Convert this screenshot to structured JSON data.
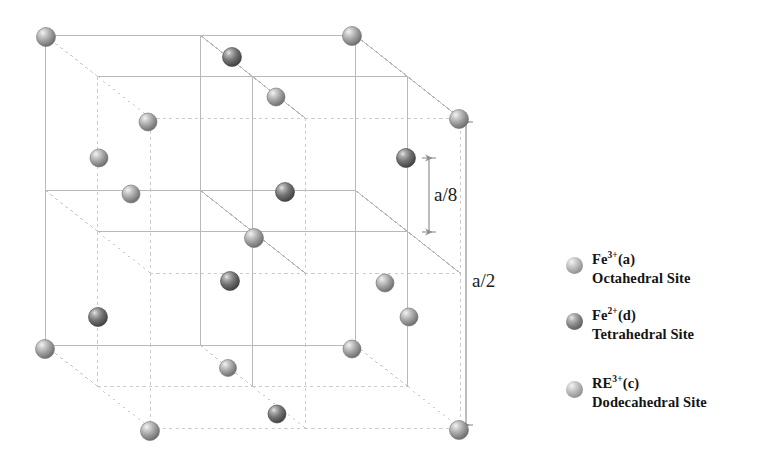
{
  "figure": {
    "name": "garnet-unit-cell-octant",
    "background_color": "#ffffff",
    "line_color": "#b9b9b9",
    "dashed_line_color": "#c6c6c6",
    "arrow_color": "#8f8f8f"
  },
  "cube": {
    "front": {
      "x": 45,
      "y": 35,
      "size": 310
    },
    "depth": {
      "dx": 105,
      "dy": 83
    }
  },
  "dimensions": [
    {
      "id": "a8",
      "label": "a/8",
      "x": 429,
      "y_top": 158,
      "y_bottom": 232,
      "label_x": 434,
      "label_y": 184
    },
    {
      "id": "a2",
      "label": "a/2",
      "x": 466,
      "y_top": 122,
      "y_bottom": 425,
      "label_x": 472,
      "label_y": 270
    }
  ],
  "atom_colors": {
    "light": "#9c9c9c",
    "dark": "#6d6d6d",
    "highlight": "#f2f2f2"
  },
  "atoms": [
    {
      "x": 46,
      "y": 37,
      "r": 9.5,
      "tone": "light"
    },
    {
      "x": 232,
      "y": 57,
      "r": 9.5,
      "tone": "dark"
    },
    {
      "x": 352,
      "y": 36,
      "r": 9.5,
      "tone": "light"
    },
    {
      "x": 276,
      "y": 97,
      "r": 9.0,
      "tone": "light"
    },
    {
      "x": 148,
      "y": 122,
      "r": 9.0,
      "tone": "light"
    },
    {
      "x": 459,
      "y": 119,
      "r": 9.5,
      "tone": "light"
    },
    {
      "x": 99,
      "y": 158,
      "r": 9.0,
      "tone": "light"
    },
    {
      "x": 406,
      "y": 158,
      "r": 9.5,
      "tone": "dark"
    },
    {
      "x": 131,
      "y": 194,
      "r": 9.0,
      "tone": "light"
    },
    {
      "x": 285,
      "y": 192,
      "r": 9.5,
      "tone": "dark"
    },
    {
      "x": 254,
      "y": 238,
      "r": 9.5,
      "tone": "light"
    },
    {
      "x": 230,
      "y": 281,
      "r": 9.5,
      "tone": "dark"
    },
    {
      "x": 385,
      "y": 283,
      "r": 9.0,
      "tone": "light"
    },
    {
      "x": 98,
      "y": 317,
      "r": 9.5,
      "tone": "dark"
    },
    {
      "x": 409,
      "y": 317,
      "r": 9.0,
      "tone": "light"
    },
    {
      "x": 45,
      "y": 349,
      "r": 9.5,
      "tone": "light"
    },
    {
      "x": 352,
      "y": 349,
      "r": 9.0,
      "tone": "light"
    },
    {
      "x": 228,
      "y": 368,
      "r": 8.5,
      "tone": "light"
    },
    {
      "x": 277,
      "y": 414,
      "r": 9.0,
      "tone": "dark"
    },
    {
      "x": 150,
      "y": 431,
      "r": 9.5,
      "tone": "light"
    },
    {
      "x": 459,
      "y": 430,
      "r": 9.5,
      "tone": "light"
    }
  ],
  "legend": {
    "items": [
      {
        "id": "fe3-octahedral",
        "sphere_x": 566,
        "sphere_y": 257,
        "text_x": 589,
        "text_y": 250,
        "tone": "light",
        "ion": "Fe",
        "charge": "3+",
        "site_code": "(a)",
        "site_name": "Octahedral Site"
      },
      {
        "id": "fe2-tetrahedral",
        "sphere_x": 566,
        "sphere_y": 313,
        "text_x": 589,
        "text_y": 306,
        "tone": "dark",
        "ion": "Fe",
        "charge": "2+",
        "site_code": "(d)",
        "site_name": "Tetrahedral Site"
      },
      {
        "id": "re3-dodecahedral",
        "sphere_x": 566,
        "sphere_y": 381,
        "text_x": 589,
        "text_y": 374,
        "tone": "light",
        "ion": "RE",
        "charge": "3+",
        "site_code": "(c)",
        "site_name": "Dodecahedral Site"
      }
    ]
  }
}
